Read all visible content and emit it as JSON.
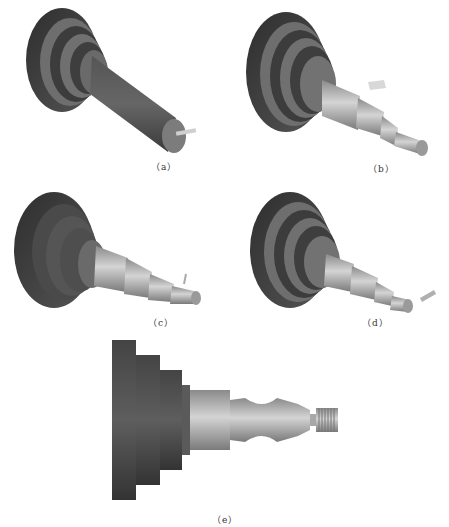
{
  "figure": {
    "panels": [
      {
        "id": "a",
        "caption": "（a）"
      },
      {
        "id": "b",
        "caption": "（b）"
      },
      {
        "id": "c",
        "caption": "（c）"
      },
      {
        "id": "d",
        "caption": "（d）"
      },
      {
        "id": "e",
        "caption": "（e）"
      }
    ]
  },
  "colors": {
    "dark_body": "#3a3a3a",
    "mid_body": "#6a6a6a",
    "light_shaft": "#b8b8b8",
    "background": "#ffffff"
  }
}
